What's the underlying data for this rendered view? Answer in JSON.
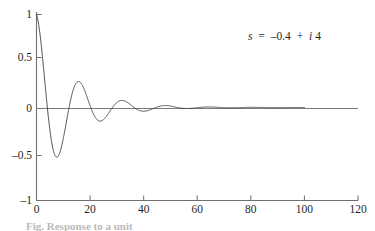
{
  "figure": {
    "annotation": "s = –0.4 + i4",
    "annotation_parts": {
      "s": "s",
      "equals": "=",
      "real": "–0.4",
      "plus": "+",
      "imag_unit": "i",
      "imag": "4"
    },
    "partial_caption": "Fig. Response to a unit"
  },
  "colors": {
    "curve": "#3a3a3a",
    "axis": "#6f6f6f",
    "zero_line": "#7a7a7a",
    "text": "#1f1f1f",
    "background": "#ffffff"
  },
  "chart_data": {
    "type": "line",
    "title": "",
    "xlabel": "",
    "ylabel": "",
    "xlim": [
      0,
      120
    ],
    "ylim": [
      -1,
      1
    ],
    "xticks": [
      0,
      20,
      40,
      60,
      80,
      100,
      120
    ],
    "xtick_labels": [
      "0",
      "20",
      "40",
      "60",
      "80",
      "100",
      "120"
    ],
    "yticks": [
      -1,
      -0.5,
      0,
      0.5,
      1
    ],
    "ytick_labels": [
      "–1",
      "–0.5",
      "0",
      "0.5",
      "1"
    ],
    "grid": false,
    "legend": "none",
    "annotations": [
      {
        "text": "s = –0.4 + i4",
        "x": 78,
        "y": 0.83
      }
    ],
    "series": [
      {
        "name": "damped oscillation",
        "description": "y(t) = exp(-t/12.5) * cos(2*pi*t/16.2), damped cosine for pole s = -0.4 + i4",
        "decay_tau": 12.5,
        "period": 16.2,
        "t_start": 0,
        "t_end": 100,
        "key_points": [
          {
            "x": 0,
            "y": 1.0
          },
          {
            "x": 4,
            "y": 0.0
          },
          {
            "x": 8.1,
            "y": -0.72
          },
          {
            "x": 12,
            "y": 0.0
          },
          {
            "x": 16.2,
            "y": 0.53
          },
          {
            "x": 20,
            "y": 0.0
          },
          {
            "x": 24.3,
            "y": -0.39
          },
          {
            "x": 28,
            "y": 0.0
          },
          {
            "x": 32.4,
            "y": 0.28
          },
          {
            "x": 36,
            "y": 0.0
          },
          {
            "x": 40.5,
            "y": -0.21
          },
          {
            "x": 44,
            "y": 0.0
          },
          {
            "x": 48.6,
            "y": 0.15
          },
          {
            "x": 53,
            "y": 0.0
          },
          {
            "x": 56.7,
            "y": -0.11
          },
          {
            "x": 61,
            "y": 0.0
          },
          {
            "x": 64.8,
            "y": 0.085
          },
          {
            "x": 69,
            "y": 0.0
          },
          {
            "x": 72.9,
            "y": -0.06
          },
          {
            "x": 77,
            "y": 0.0
          },
          {
            "x": 81.0,
            "y": 0.045
          },
          {
            "x": 85,
            "y": 0.0
          },
          {
            "x": 89.1,
            "y": -0.033
          },
          {
            "x": 93,
            "y": 0.0
          },
          {
            "x": 97.2,
            "y": 0.025
          },
          {
            "x": 100,
            "y": 0.005
          }
        ]
      },
      {
        "name": "zero reference line",
        "description": "horizontal axis at y = 0 spanning x = 0 to 120",
        "y": 0,
        "x_range": [
          0,
          120
        ]
      }
    ]
  }
}
